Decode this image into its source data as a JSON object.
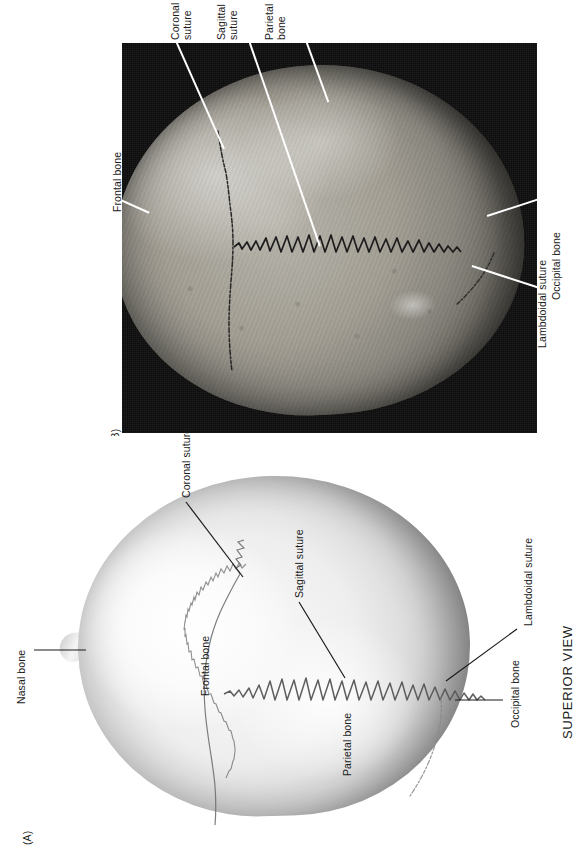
{
  "figure": {
    "caption": "SUPERIOR VIEW",
    "panels": [
      {
        "id": "panel-a",
        "marker": "(A)",
        "type": "illustration",
        "description": "Line drawing of the skull viewed from above",
        "labels": [
          {
            "name": "nasal-bone",
            "text": "Nasal bone",
            "lines": [
              "Nasal bone"
            ]
          },
          {
            "name": "frontal-bone",
            "text": "Frontal bone",
            "lines": [
              "Frontal bone"
            ]
          },
          {
            "name": "coronal-suture",
            "text": "Coronal suture",
            "lines": [
              "Coronal suture"
            ]
          },
          {
            "name": "sagittal-suture",
            "text": "Sagittal suture",
            "lines": [
              "Sagittal suture"
            ]
          },
          {
            "name": "parietal-bone",
            "text": "Parietal bone",
            "lines": [
              "Parietal bone"
            ]
          },
          {
            "name": "occipital-bone",
            "text": "Occipital bone",
            "lines": [
              "Occipital bone"
            ]
          },
          {
            "name": "lambdoidal-suture",
            "text": "Lambdoidal suture",
            "lines": [
              "Lambdoidal suture"
            ]
          }
        ]
      },
      {
        "id": "panel-b",
        "marker": "(B)",
        "type": "photograph",
        "description": "Black-and-white photograph of a dry skull viewed from above",
        "labels": [
          {
            "name": "coronal-suture",
            "text": "Coronal suture",
            "lines": [
              "Coronal",
              "suture"
            ]
          },
          {
            "name": "sagittal-suture",
            "text": "Sagittal suture",
            "lines": [
              "Sagittal",
              "suture"
            ]
          },
          {
            "name": "parietal-bone",
            "text": "Parietal bone",
            "lines": [
              "Parietal",
              "bone"
            ]
          },
          {
            "name": "frontal-bone",
            "text": "Frontal bone",
            "lines": [
              "Frontal bone"
            ]
          },
          {
            "name": "occipital-bone",
            "text": "Occipital bone",
            "lines": [
              "Occipital bone"
            ]
          },
          {
            "name": "lambdoidal-suture",
            "text": "Lambdoidal suture",
            "lines": [
              "Lambdoidal suture"
            ]
          }
        ]
      }
    ],
    "colors": {
      "page_background": "#ffffff",
      "photo_background": "#0d0d0d",
      "label_text": "#1b1b1b",
      "photo_label_text": "#ffffff",
      "leader_line": "#1b1b1b",
      "photo_leader_line": "#ffffff",
      "bone_light": "#fafafa",
      "bone_shadow": "#a9a9a9",
      "photo_bone": "#a39f95"
    }
  },
  "panel_a_text": {
    "marker": "(A)",
    "nasal_bone": "Nasal bone",
    "frontal_bone": "Frontal bone",
    "coronal_suture": "Coronal suture",
    "sagittal_suture": "Sagittal suture",
    "parietal_bone": "Parietal bone",
    "occipital_bone": "Occipital bone",
    "lambdoidal_suture": "Lambdoidal suture",
    "view_caption": "SUPERIOR VIEW"
  },
  "panel_b_text": {
    "marker": "(B)",
    "coronal_suture_l1": "Coronal",
    "coronal_suture_l2": "suture",
    "sagittal_suture_l1": "Sagittal",
    "sagittal_suture_l2": "suture",
    "parietal_bone_l1": "Parietal",
    "parietal_bone_l2": "bone",
    "frontal_bone": "Frontal bone",
    "occipital_bone": "Occipital bone",
    "lambdoidal_suture": "Lambdoidal suture"
  }
}
